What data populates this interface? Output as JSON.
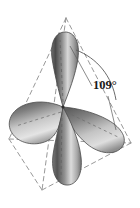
{
  "figure": {
    "name": "sp3-hybrid-orbital-tetrahedron",
    "background_color": "#ffffff",
    "annotations": {
      "bond_angle_label": "109°"
    },
    "geometry": {
      "tetrahedron": {
        "apex": [
          66,
          18
        ],
        "front_left": [
          42,
          190
        ],
        "right": [
          131,
          143
        ],
        "back_left": [
          9,
          139
        ]
      },
      "center": [
        63,
        107
      ],
      "lobes": [
        {
          "name": "lobe-up",
          "tip": [
            63,
            107
          ],
          "direction": "up",
          "bulb_center": [
            60,
            53
          ]
        },
        {
          "name": "lobe-left",
          "tip": [
            63,
            107
          ],
          "direction": "left",
          "bulb_center": [
            28,
            131
          ]
        },
        {
          "name": "lobe-right",
          "tip": [
            63,
            107
          ],
          "direction": "right-down",
          "bulb_center": [
            106,
            134
          ]
        },
        {
          "name": "lobe-down",
          "tip": [
            63,
            107
          ],
          "direction": "down",
          "bulb_center": [
            65,
            163
          ]
        }
      ]
    },
    "colors": {
      "outline_dash": "#8c8c8c",
      "lobe_dark": "#4b4b4b",
      "lobe_mid": "#8f8f8f",
      "lobe_light": "#e2e2e2",
      "label_text": "#1a1a1a",
      "arc_line": "#5a5a5a"
    }
  }
}
